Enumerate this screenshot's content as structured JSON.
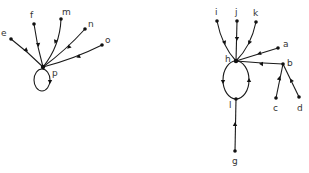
{
  "diagram": {
    "type": "directed-graph",
    "colors": {
      "stroke": "#1a1a1a",
      "node": "#111111",
      "label": "#333333",
      "background": "#ffffff"
    },
    "left_graph": {
      "nodes": [
        {
          "id": "e",
          "label": "e"
        },
        {
          "id": "f",
          "label": "f"
        },
        {
          "id": "m",
          "label": "m"
        },
        {
          "id": "n",
          "label": "n"
        },
        {
          "id": "o",
          "label": "o"
        },
        {
          "id": "p",
          "label": "p"
        }
      ],
      "edges": [
        {
          "from": "e",
          "to": "p"
        },
        {
          "from": "f",
          "to": "p"
        },
        {
          "from": "m",
          "to": "p"
        },
        {
          "from": "n",
          "to": "p"
        },
        {
          "from": "o",
          "to": "p"
        },
        {
          "from": "p",
          "to": "p",
          "kind": "self-loop"
        }
      ]
    },
    "right_graph": {
      "nodes": [
        {
          "id": "i",
          "label": "i"
        },
        {
          "id": "j",
          "label": "j"
        },
        {
          "id": "k",
          "label": "k"
        },
        {
          "id": "h",
          "label": "h"
        },
        {
          "id": "a",
          "label": "a"
        },
        {
          "id": "b",
          "label": "b"
        },
        {
          "id": "c",
          "label": "c"
        },
        {
          "id": "d",
          "label": "d"
        },
        {
          "id": "l",
          "label": "l"
        },
        {
          "id": "g",
          "label": "g"
        }
      ],
      "edges": [
        {
          "from": "i",
          "to": "h"
        },
        {
          "from": "j",
          "to": "h"
        },
        {
          "from": "k",
          "to": "h"
        },
        {
          "from": "a",
          "to": "h"
        },
        {
          "from": "b",
          "to": "h"
        },
        {
          "from": "c",
          "to": "b"
        },
        {
          "from": "d",
          "to": "b"
        },
        {
          "from": "h",
          "to": "l"
        },
        {
          "from": "l",
          "to": "h"
        },
        {
          "from": "g",
          "to": "l"
        }
      ]
    }
  }
}
